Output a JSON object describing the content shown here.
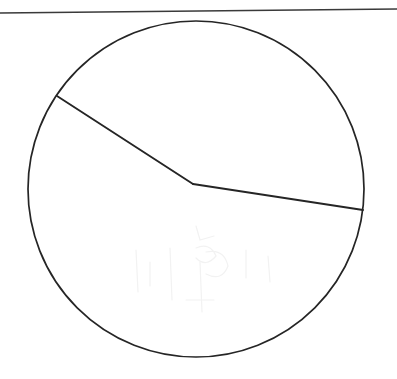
{
  "page": {
    "background_color": "#ffffff",
    "width": 397,
    "height": 379,
    "ink_color": "#252525",
    "rule_color": "#3a3a3a",
    "ghost_color": "#f2f2f2"
  },
  "figure": {
    "type": "geometry-diagram",
    "rule": {
      "name": "top-horizontal-rule",
      "x1": 0,
      "y1": 13,
      "x2": 397,
      "y2": 9,
      "stroke_width": 1.5
    },
    "circle": {
      "name": "main-circle",
      "cx": 196,
      "cy": 189,
      "r": 168,
      "stroke_width": 1.7,
      "bbox": {
        "left": 28,
        "top": 21,
        "right": 364,
        "bottom": 357
      }
    },
    "points": [
      {
        "label": "A",
        "role": "chord-start-on-arc",
        "x": 57,
        "y": 96
      },
      {
        "label": "B",
        "role": "interior-vertex",
        "x": 193,
        "y": 184
      },
      {
        "label": "C",
        "role": "chord-end-on-arc",
        "x": 363,
        "y": 210
      }
    ],
    "segments": [
      {
        "name": "upper-chord-segment",
        "from": "A",
        "to": "B",
        "x1": 57,
        "y1": 96,
        "x2": 193,
        "y2": 184,
        "stroke_width": 1.9
      },
      {
        "name": "lower-chord-segment",
        "from": "B",
        "to": "C",
        "x1": 193,
        "y1": 184,
        "x2": 363,
        "y2": 210,
        "stroke_width": 1.9
      }
    ],
    "ghost_marks": {
      "visible": true,
      "note": "Very faint scan bleed-through inside the lower half of the circle; not part of the drawing."
    }
  },
  "labels": {
    "none_visible": "",
    "caption": ""
  }
}
